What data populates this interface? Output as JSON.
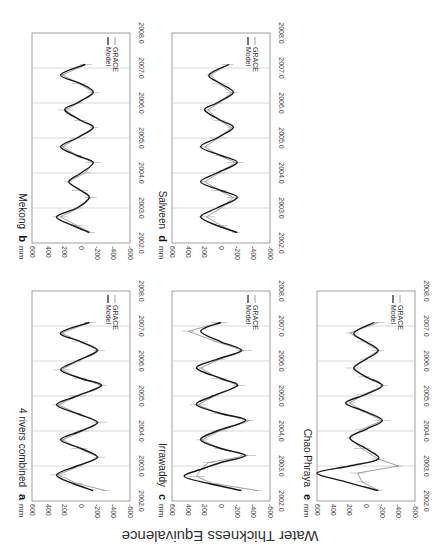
{
  "figure": {
    "shared_ylabel": "Water Thickness Equivalence",
    "unit": "mm",
    "legend": [
      "Model",
      "GRACE"
    ],
    "x_ticks": [
      "2002.0",
      "2003.0",
      "2004.0",
      "2005.0",
      "2006.0",
      "2007.0",
      "2008.0"
    ],
    "y_ticks": [
      "600",
      "400",
      "200",
      "0",
      "-200",
      "-400",
      "-600"
    ]
  },
  "chart_data": [
    {
      "type": "line",
      "panel": "a",
      "title": "4 rivers combined",
      "xlabel": "",
      "ylabel": "mm",
      "xlim": [
        2002.0,
        2008.0
      ],
      "ylim": [
        -600,
        600
      ],
      "x": [
        2002.3,
        2002.5,
        2002.75,
        2003.0,
        2003.25,
        2003.5,
        2003.75,
        2004.0,
        2004.25,
        2004.5,
        2004.75,
        2005.0,
        2005.3,
        2005.5,
        2005.75,
        2006.0,
        2006.3,
        2006.55,
        2006.8,
        2007.1
      ],
      "series": [
        {
          "name": "Model",
          "values": [
            -150,
            100,
            300,
            50,
            -200,
            0,
            250,
            0,
            -200,
            50,
            300,
            50,
            -250,
            0,
            250,
            50,
            -200,
            0,
            250,
            -100
          ]
        },
        {
          "name": "GRACE",
          "values": [
            -300,
            50,
            280,
            20,
            -220,
            20,
            230,
            -20,
            -220,
            40,
            280,
            40,
            -260,
            10,
            240,
            40,
            -220,
            10,
            240,
            -110
          ]
        }
      ],
      "legend_position": "upper-right",
      "grid": "vertical lines at each year"
    },
    {
      "type": "line",
      "panel": "b",
      "title": "Mekong",
      "xlabel": "",
      "ylabel": "mm",
      "xlim": [
        2002.0,
        2008.0
      ],
      "ylim": [
        -600,
        600
      ],
      "x": [
        2002.3,
        2002.5,
        2002.75,
        2003.0,
        2003.3,
        2003.5,
        2003.75,
        2004.0,
        2004.3,
        2004.5,
        2004.75,
        2005.0,
        2005.3,
        2005.5,
        2005.8,
        2006.0,
        2006.3,
        2006.55,
        2006.8,
        2007.1
      ],
      "series": [
        {
          "name": "Model",
          "values": [
            -100,
            100,
            300,
            50,
            -100,
            0,
            150,
            0,
            -150,
            50,
            250,
            50,
            -150,
            0,
            200,
            50,
            -150,
            0,
            250,
            -50
          ]
        },
        {
          "name": "GRACE",
          "values": [
            -120,
            50,
            250,
            30,
            -120,
            10,
            160,
            -50,
            -150,
            40,
            230,
            40,
            -160,
            10,
            190,
            30,
            -150,
            20,
            230,
            -60
          ]
        }
      ],
      "legend_position": "upper-right",
      "grid": "vertical lines at each year"
    },
    {
      "type": "line",
      "panel": "c",
      "title": "Irrawaddy",
      "xlabel": "",
      "ylabel": "mm",
      "xlim": [
        2002.0,
        2008.0
      ],
      "ylim": [
        -600,
        600
      ],
      "x": [
        2002.3,
        2002.5,
        2002.7,
        2002.9,
        2003.1,
        2003.3,
        2003.5,
        2003.75,
        2004.0,
        2004.3,
        2004.5,
        2004.75,
        2005.0,
        2005.3,
        2005.5,
        2005.8,
        2006.05,
        2006.3,
        2006.55,
        2006.85,
        2007.1
      ],
      "series": [
        {
          "name": "Model",
          "values": [
            -250,
            150,
            450,
            250,
            0,
            -300,
            0,
            250,
            50,
            -300,
            0,
            300,
            100,
            -200,
            0,
            300,
            50,
            -250,
            0,
            250,
            0
          ]
        },
        {
          "name": "GRACE",
          "values": [
            -450,
            100,
            300,
            250,
            150,
            -330,
            30,
            230,
            20,
            -350,
            30,
            280,
            80,
            -220,
            20,
            250,
            20,
            -280,
            50,
            400,
            20
          ]
        }
      ],
      "legend_position": "upper-right",
      "grid": "vertical lines at each year"
    },
    {
      "type": "line",
      "panel": "d",
      "title": "Salween",
      "xlabel": "",
      "ylabel": "mm",
      "xlim": [
        2002.0,
        2008.0
      ],
      "ylim": [
        -600,
        600
      ],
      "x": [
        2002.3,
        2002.5,
        2002.75,
        2003.0,
        2003.3,
        2003.5,
        2003.75,
        2004.0,
        2004.3,
        2004.5,
        2004.75,
        2005.0,
        2005.3,
        2005.5,
        2005.8,
        2006.0,
        2006.3,
        2006.55,
        2006.8,
        2007.1
      ],
      "series": [
        {
          "name": "Model",
          "values": [
            -200,
            50,
            250,
            50,
            -200,
            0,
            250,
            50,
            -200,
            0,
            250,
            50,
            -150,
            0,
            200,
            50,
            -150,
            0,
            150,
            -100
          ]
        },
        {
          "name": "GRACE",
          "values": [
            -180,
            0,
            180,
            0,
            -150,
            20,
            200,
            30,
            -180,
            20,
            200,
            30,
            -130,
            20,
            160,
            30,
            -130,
            20,
            130,
            -80
          ]
        }
      ],
      "legend_position": "upper-right",
      "grid": "vertical lines at each year"
    },
    {
      "type": "line",
      "panel": "e",
      "title": "Chao Phraya",
      "xlabel": "",
      "ylabel": "mm",
      "xlim": [
        2002.0,
        2008.0
      ],
      "ylim": [
        -600,
        600
      ],
      "x": [
        2002.3,
        2002.55,
        2002.8,
        2003.0,
        2003.2,
        2003.5,
        2003.8,
        2004.05,
        2004.3,
        2004.55,
        2004.8,
        2005.05,
        2005.3,
        2005.55,
        2005.8,
        2006.05,
        2006.3,
        2006.55,
        2006.8,
        2007.1
      ],
      "series": [
        {
          "name": "Model",
          "values": [
            -150,
            250,
            600,
            200,
            -150,
            0,
            200,
            0,
            -200,
            0,
            250,
            0,
            -200,
            0,
            150,
            0,
            -150,
            0,
            150,
            -100
          ]
        },
        {
          "name": "GRACE",
          "values": [
            -150,
            50,
            100,
            -400,
            -150,
            50,
            200,
            50,
            -200,
            20,
            200,
            20,
            -220,
            20,
            150,
            20,
            -150,
            20,
            200,
            -150
          ]
        }
      ],
      "legend_position": "upper-right",
      "grid": "vertical lines at each year"
    }
  ],
  "panels": {
    "a": {
      "letter": "a",
      "title": "4 rivers combined"
    },
    "b": {
      "letter": "b",
      "title": "Mekong"
    },
    "c": {
      "letter": "c",
      "title": "Irrawaddy"
    },
    "d": {
      "letter": "d",
      "title": "Salween"
    },
    "e": {
      "letter": "e",
      "title": "Chao Phraya"
    }
  }
}
